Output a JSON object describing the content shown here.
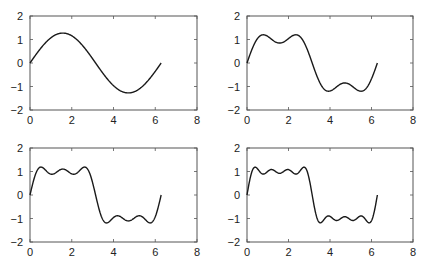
{
  "figure": {
    "width": 424,
    "height": 269,
    "line_color": "#1a1a1a",
    "axes_color": "#555555"
  },
  "chart_data": [
    {
      "type": "line",
      "title": "",
      "xlabel": "",
      "ylabel": "",
      "xlim": [
        0,
        8
      ],
      "ylim": [
        -2,
        2
      ],
      "xticks": [
        0,
        2,
        4,
        6,
        8
      ],
      "yticks": [
        -2,
        -1,
        0,
        1,
        2
      ],
      "xtick_labels": [
        "0",
        "2",
        "4",
        "6",
        "8"
      ],
      "ytick_labels": [
        "−2",
        "−1",
        "0",
        "1",
        "2"
      ],
      "grid": false,
      "legend": null,
      "series": [
        {
          "name": "Fourier square wave, 1 term",
          "terms": 1,
          "x_range": [
            0,
            6.2832
          ],
          "description": "y = (4/pi) * sin(x); peak ~1.27 at x~1.57, trough ~-1.27 at x~4.71"
        }
      ],
      "position": {
        "left": 30,
        "top": 16,
        "right": 197,
        "bottom": 110
      }
    },
    {
      "type": "line",
      "title": "",
      "xlabel": "",
      "ylabel": "",
      "xlim": [
        0,
        8
      ],
      "ylim": [
        -2,
        2
      ],
      "xticks": [
        0,
        2,
        4,
        6,
        8
      ],
      "yticks": [
        -2,
        -1,
        0,
        1,
        2
      ],
      "xtick_labels": [
        "0",
        "2",
        "4",
        "6",
        "8"
      ],
      "ytick_labels": [
        "−2",
        "−1",
        "0",
        "1",
        "2"
      ],
      "grid": false,
      "legend": null,
      "series": [
        {
          "name": "Fourier square wave, 2 terms",
          "terms": 2,
          "x_range": [
            0,
            6.2832
          ],
          "description": "peaks ~1.2 at x~0.8 and x~2.35, dip ~0.85 at x~1.57"
        }
      ],
      "position": {
        "left": 247,
        "top": 16,
        "right": 413,
        "bottom": 110
      }
    },
    {
      "type": "line",
      "title": "",
      "xlabel": "",
      "ylabel": "",
      "xlim": [
        0,
        8
      ],
      "ylim": [
        -2,
        2
      ],
      "xticks": [
        0,
        2,
        4,
        6,
        8
      ],
      "yticks": [
        -2,
        -1,
        0,
        1,
        2
      ],
      "xtick_labels": [
        "0",
        "2",
        "4",
        "6",
        "8"
      ],
      "ytick_labels": [
        "−2",
        "−1",
        "0",
        "1",
        "2"
      ],
      "grid": false,
      "legend": null,
      "series": [
        {
          "name": "Fourier square wave, 3 terms",
          "terms": 3,
          "x_range": [
            0,
            6.2832
          ],
          "description": "three ripples near +1.1 on (0,pi), three near -1.1 on (pi,2pi)"
        }
      ],
      "position": {
        "left": 30,
        "top": 148,
        "right": 197,
        "bottom": 242
      }
    },
    {
      "type": "line",
      "title": "",
      "xlabel": "",
      "ylabel": "",
      "xlim": [
        0,
        8
      ],
      "ylim": [
        -2,
        2
      ],
      "xticks": [
        0,
        2,
        4,
        6,
        8
      ],
      "yticks": [
        -2,
        -1,
        0,
        1,
        2
      ],
      "xtick_labels": [
        "0",
        "2",
        "4",
        "6",
        "8"
      ],
      "ytick_labels": [
        "−2",
        "−1",
        "0",
        "1",
        "2"
      ],
      "grid": false,
      "legend": null,
      "series": [
        {
          "name": "Fourier square wave, 4 terms",
          "terms": 4,
          "x_range": [
            0,
            6.2832
          ],
          "description": "four ripples near +1.1 on (0,pi), four near -1.1 on (pi,2pi)"
        }
      ],
      "position": {
        "left": 247,
        "top": 148,
        "right": 413,
        "bottom": 242
      }
    }
  ]
}
